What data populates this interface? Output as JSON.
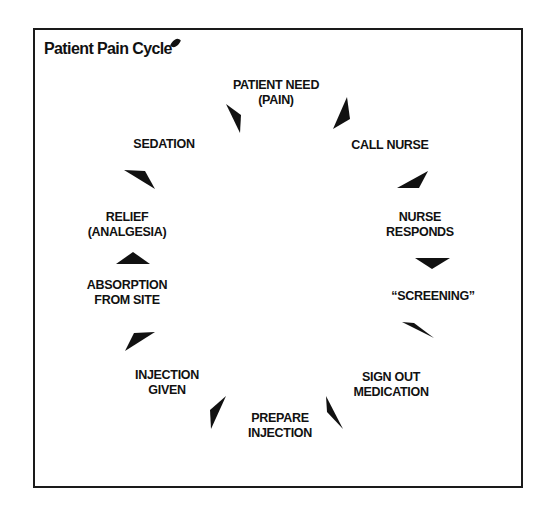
{
  "diagram": {
    "title": "Patient Pain Cycle",
    "type": "cycle",
    "colors": {
      "ink": "#111111",
      "background": "#ffffff",
      "border": "#1a1a1a"
    },
    "steps": [
      {
        "id": "patient-need",
        "lines": [
          "PATIENT NEED",
          "(PAIN)"
        ],
        "x": 276,
        "y": 78
      },
      {
        "id": "call-nurse",
        "lines": [
          "CALL NURSE"
        ],
        "x": 390,
        "y": 138
      },
      {
        "id": "nurse-responds",
        "lines": [
          "NURSE",
          "RESPONDS"
        ],
        "x": 420,
        "y": 210
      },
      {
        "id": "screening",
        "lines": [
          "“SCREENING”"
        ],
        "x": 433,
        "y": 289
      },
      {
        "id": "sign-out-medication",
        "lines": [
          "SIGN OUT",
          "MEDICATION"
        ],
        "x": 391,
        "y": 370
      },
      {
        "id": "prepare-injection",
        "lines": [
          "PREPARE",
          "INJECTION"
        ],
        "x": 280,
        "y": 411
      },
      {
        "id": "injection-given",
        "lines": [
          "INJECTION",
          "GIVEN"
        ],
        "x": 167,
        "y": 368
      },
      {
        "id": "absorption-from-site",
        "lines": [
          "ABSORPTION",
          "FROM SITE"
        ],
        "x": 127,
        "y": 278
      },
      {
        "id": "relief-analgesia",
        "lines": [
          "RELIEF",
          "(ANALGESIA)"
        ],
        "x": 127,
        "y": 210
      },
      {
        "id": "sedation",
        "lines": [
          "SEDATION"
        ],
        "x": 164,
        "y": 137
      }
    ],
    "arrows": [
      {
        "from": "sedation",
        "to": "patient-need",
        "points": "226,104 241,115 240,133"
      },
      {
        "from": "patient-need",
        "to": "call-nurse",
        "points": "347,97 350,119 333,129"
      },
      {
        "from": "call-nurse",
        "to": "nurse-responds",
        "points": "428,171 419,188 397,188"
      },
      {
        "from": "nurse-responds",
        "to": "screening",
        "points": "415,258 450,258 432,269"
      },
      {
        "from": "screening",
        "to": "sign-out-medication",
        "points": "402,322 414,323 434,338"
      },
      {
        "from": "sign-out-medication",
        "to": "prepare-injection",
        "points": "326,396 343,429 327,412"
      },
      {
        "from": "prepare-injection",
        "to": "injection-given",
        "points": "226,396 211,429 210,410"
      },
      {
        "from": "injection-given",
        "to": "absorption-from-site",
        "points": "134,333 155,332 125,351"
      },
      {
        "from": "absorption-from-site",
        "to": "relief-analgesia",
        "points": "116,264 150,264 133,252"
      },
      {
        "from": "relief-analgesia",
        "to": "sedation",
        "points": "124,170 145,171 155,189"
      }
    ]
  }
}
